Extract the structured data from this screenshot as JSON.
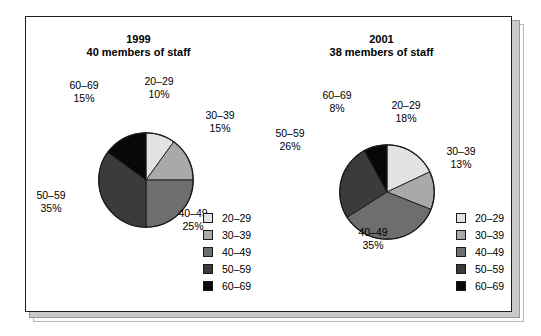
{
  "figure": {
    "background": "#ffffff",
    "card_border_color": "#1d1d1d",
    "shadow_color": "#c9c9c9"
  },
  "palette": {
    "20-29": "#e2e2e2",
    "30-39": "#a9a9a9",
    "40-49": "#6e6e6e",
    "50-59": "#3b3b3b",
    "60-69": "#080808"
  },
  "legend_labels": [
    "20–29",
    "30–39",
    "40–49",
    "50–59",
    "60–69"
  ],
  "chart_data": [
    {
      "type": "pie",
      "title": "1999",
      "subtitle": "40 members of staff",
      "categories": [
        "20–29",
        "30–39",
        "40–49",
        "50–59",
        "60–69"
      ],
      "values": [
        10,
        15,
        25,
        35,
        15
      ],
      "value_labels": [
        "10%",
        "15%",
        "25%",
        "35%",
        "15%"
      ],
      "unit": "%",
      "total_members": 40,
      "start_angle": 0,
      "direction": "clockwise",
      "legend": {
        "position": "bottom-right",
        "entries": [
          {
            "label": "20–29",
            "color": "#e2e2e2"
          },
          {
            "label": "30–39",
            "color": "#a9a9a9"
          },
          {
            "label": "40–49",
            "color": "#6e6e6e"
          },
          {
            "label": "50–59",
            "color": "#3b3b3b"
          },
          {
            "label": "60–69",
            "color": "#080808"
          }
        ]
      },
      "callouts": [
        {
          "name": "20-29",
          "group": "20–29",
          "pct": "10%"
        },
        {
          "name": "30-39",
          "group": "30–39",
          "pct": "15%"
        },
        {
          "name": "40-49",
          "group": "40–49",
          "pct": "25%"
        },
        {
          "name": "50-59",
          "group": "50–59",
          "pct": "35%"
        },
        {
          "name": "60-69",
          "group": "60–69",
          "pct": "15%"
        }
      ]
    },
    {
      "type": "pie",
      "title": "2001",
      "subtitle": "38 members of staff",
      "categories": [
        "20–29",
        "30–39",
        "40–49",
        "50–59",
        "60–69"
      ],
      "values": [
        18,
        13,
        35,
        26,
        8
      ],
      "value_labels": [
        "18%",
        "13%",
        "35%",
        "26%",
        "8%"
      ],
      "unit": "%",
      "total_members": 38,
      "start_angle": 0,
      "direction": "clockwise",
      "legend": {
        "position": "bottom-right",
        "entries": [
          {
            "label": "20–29",
            "color": "#e2e2e2"
          },
          {
            "label": "30–39",
            "color": "#a9a9a9"
          },
          {
            "label": "40–49",
            "color": "#6e6e6e"
          },
          {
            "label": "50–59",
            "color": "#3b3b3b"
          },
          {
            "label": "60–69",
            "color": "#080808"
          }
        ]
      },
      "callouts": [
        {
          "name": "20-29",
          "group": "20–29",
          "pct": "18%"
        },
        {
          "name": "30-39",
          "group": "30–39",
          "pct": "13%"
        },
        {
          "name": "40-49",
          "group": "40–49",
          "pct": "35%"
        },
        {
          "name": "50-59",
          "group": "50–59",
          "pct": "26%"
        },
        {
          "name": "60-69",
          "group": "60–69",
          "pct": "8%"
        }
      ]
    }
  ]
}
